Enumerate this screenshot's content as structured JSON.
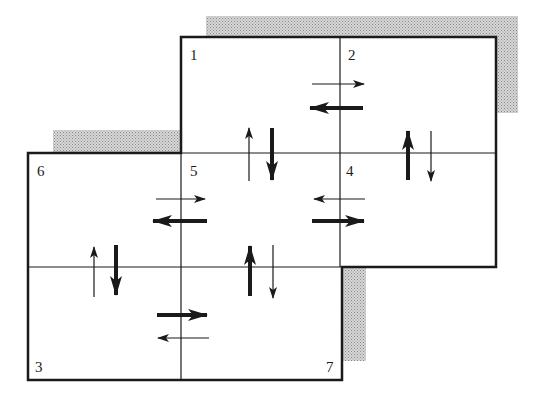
{
  "diagram": {
    "type": "grid-flow-diagram",
    "colors": {
      "line": "#1a1a1a",
      "shadow": "#bdbdbd",
      "background": "#ffffff"
    },
    "regions": [
      {
        "id": "1",
        "label": "1"
      },
      {
        "id": "2",
        "label": "2"
      },
      {
        "id": "3",
        "label": "3"
      },
      {
        "id": "4",
        "label": "4"
      },
      {
        "id": "5",
        "label": "5"
      },
      {
        "id": "6",
        "label": "6"
      },
      {
        "id": "7",
        "label": "7"
      }
    ],
    "arrow_pairs": [
      {
        "boundary": "1|2",
        "thin": "right",
        "thick": "left"
      },
      {
        "boundary": "1|5",
        "thin": "up",
        "thick": "down"
      },
      {
        "boundary": "2|4",
        "thin": "down",
        "thick": "up"
      },
      {
        "boundary": "6|5",
        "thin": "right",
        "thick": "left"
      },
      {
        "boundary": "5|4",
        "thin": "left",
        "thick": "right"
      },
      {
        "boundary": "6|3",
        "thin": "up",
        "thick": "down"
      },
      {
        "boundary": "5|7",
        "thin": "down",
        "thick": "up"
      },
      {
        "boundary": "3|7",
        "thin": "left",
        "thick": "right"
      }
    ]
  }
}
